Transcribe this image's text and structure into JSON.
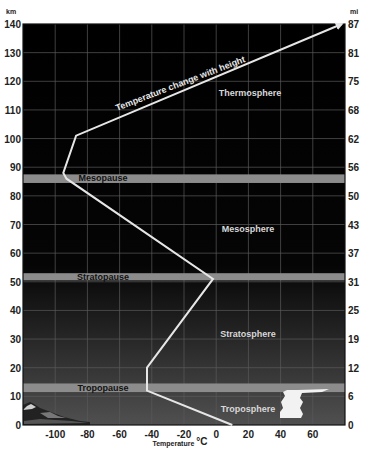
{
  "chart_data": {
    "type": "line",
    "title": "",
    "xlabel": "Temperature °C",
    "ylabel_left": "km",
    "ylabel_right": "mi",
    "xlim": [
      -120,
      80
    ],
    "ylim": [
      0,
      140
    ],
    "grid": true,
    "x_ticks": [
      -100,
      -80,
      -60,
      -40,
      -20,
      0,
      20,
      40,
      60
    ],
    "y_ticks_km": [
      0,
      10,
      20,
      30,
      40,
      50,
      60,
      70,
      80,
      90,
      100,
      110,
      120,
      130,
      140
    ],
    "y_ticks_mi": [
      0,
      6,
      12,
      19,
      25,
      31,
      37,
      43,
      50,
      56,
      62,
      68,
      75,
      81,
      87
    ],
    "series": [
      {
        "name": "Temperature change with height",
        "x": [
          10,
          -43,
          -43,
          -2,
          -93,
          -95,
          -87,
          78
        ],
        "y": [
          0,
          12,
          20,
          51,
          86,
          88,
          101,
          140
        ]
      }
    ],
    "pauses": [
      {
        "label": "Tropopause",
        "km_low": 11.5,
        "km_high": 14.5
      },
      {
        "label": "Stratopause",
        "km_low": 50.5,
        "km_high": 53
      },
      {
        "label": "Mesopause",
        "km_low": 84.5,
        "km_high": 87.5
      }
    ],
    "layers": [
      {
        "label": "Troposphere",
        "x": 50,
        "y": 5
      },
      {
        "label": "Stratosphere",
        "x": 50,
        "y": 32
      },
      {
        "label": "Mesosphere",
        "x": 50,
        "y": 68
      },
      {
        "label": "Thermosphere",
        "x": 50,
        "y": 115
      }
    ],
    "annotations": [
      {
        "text": "Temperature change with height",
        "x": -30,
        "y": 115,
        "rotation": -22
      }
    ]
  },
  "labels": {
    "km": "km",
    "mi": "mi",
    "xlabel": "Temperature",
    "xunit": "°C",
    "curve": "Temperature change with height",
    "thermosphere": "Thermosphere",
    "mesosphere": "Mesosphere",
    "stratosphere": "Stratosphere",
    "troposphere": "Troposphere",
    "mesopause": "Mesopause",
    "stratopause": "Stratopause",
    "tropopause": "Tropopause"
  },
  "colors": {
    "sky_top": "#000000",
    "sky_bottom": "#4a4a4a",
    "pause_band": "#8c8c8c",
    "curve": "#e6e6e6",
    "grid": "#6a6a6a"
  }
}
